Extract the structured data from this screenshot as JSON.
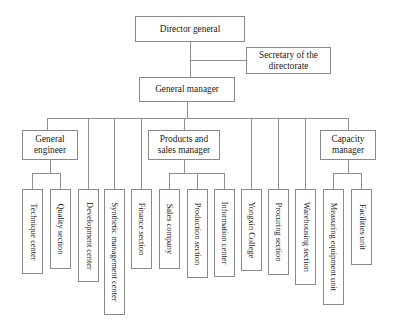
{
  "diagram": {
    "background_color": "#ffffff",
    "box_border_color": "#8a8a8a",
    "connector_color": "#8f8f8f",
    "levels": {
      "level_1": "Director general",
      "level_1_staff": "Secretary of the directorate",
      "level_2": "General manager",
      "level_3": [
        "General engineer",
        "Products and sales manager",
        "Capacity manager"
      ],
      "level_4_count": 13
    },
    "nodes": {
      "director_general": {
        "label": "Director general",
        "x": 135,
        "y": 16,
        "w": 110,
        "h": 26,
        "orient": "horizontal"
      },
      "secretary": {
        "label": "Secretary of the\ndirectorate",
        "x": 246,
        "y": 47,
        "w": 85,
        "h": 27,
        "orient": "horizontal"
      },
      "general_manager": {
        "label": "General manager",
        "x": 139,
        "y": 77,
        "w": 96,
        "h": 25,
        "orient": "horizontal"
      },
      "general_engineer": {
        "label": "General\nengineer",
        "x": 22,
        "y": 130,
        "w": 56,
        "h": 30,
        "orient": "horizontal"
      },
      "products_sales_manager": {
        "label": "Products and\nsales manager",
        "x": 148,
        "y": 130,
        "w": 72,
        "h": 30,
        "orient": "horizontal"
      },
      "capacity_manager": {
        "label": "Capacity\nmanager",
        "x": 320,
        "y": 130,
        "w": 56,
        "h": 30,
        "orient": "horizontal"
      },
      "technique_center": {
        "label": "Technique center",
        "x": 22,
        "y": 189,
        "w": 21,
        "h": 85,
        "orient": "vertical"
      },
      "quality_section": {
        "label": "Quality section",
        "x": 50,
        "y": 189,
        "w": 21,
        "h": 80,
        "orient": "vertical"
      },
      "development_center": {
        "label": "Development center",
        "x": 78,
        "y": 189,
        "w": 21,
        "h": 93,
        "orient": "vertical"
      },
      "synthetic_management_center": {
        "label": "Synthetic management center",
        "x": 104,
        "y": 189,
        "w": 21,
        "h": 126,
        "orient": "vertical"
      },
      "finance_section": {
        "label": "Finance section",
        "x": 131,
        "y": 189,
        "w": 21,
        "h": 80,
        "orient": "vertical"
      },
      "sales_company": {
        "label": "Sales company",
        "x": 159,
        "y": 189,
        "w": 21,
        "h": 80,
        "orient": "vertical"
      },
      "production_section": {
        "label": "Production section",
        "x": 187,
        "y": 189,
        "w": 21,
        "h": 89,
        "orient": "vertical"
      },
      "information_center": {
        "label": "Information center",
        "x": 214,
        "y": 189,
        "w": 21,
        "h": 88,
        "orient": "vertical"
      },
      "yongxin_college": {
        "label": "Yongxin College",
        "x": 241,
        "y": 189,
        "w": 21,
        "h": 82,
        "orient": "vertical"
      },
      "procuring_section": {
        "label": "Procuring section",
        "x": 268,
        "y": 189,
        "w": 21,
        "h": 86,
        "orient": "vertical"
      },
      "warehousing_section": {
        "label": "Warehousing section",
        "x": 295,
        "y": 189,
        "w": 21,
        "h": 96,
        "orient": "vertical"
      },
      "measuring_equipment_unit": {
        "label": "Measuring equipment unit",
        "x": 323,
        "y": 189,
        "w": 21,
        "h": 116,
        "orient": "vertical"
      },
      "facilities_unit": {
        "label": "Facilities unit",
        "x": 351,
        "y": 189,
        "w": 21,
        "h": 76,
        "orient": "vertical"
      }
    }
  }
}
